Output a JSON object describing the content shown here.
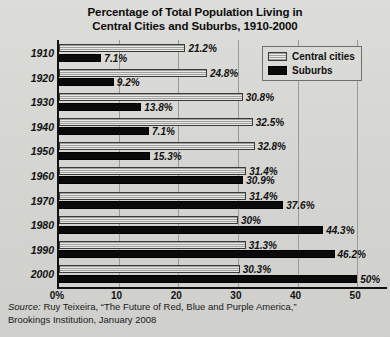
{
  "chart_data": {
    "type": "bar",
    "orientation": "horizontal",
    "title": "Percentage of Total Population Living in Central Cities and Suburbs, 1910-2000",
    "title_lines": [
      "Percentage of Total Population Living in",
      "Central Cities and Suburbs, 1910-2000"
    ],
    "xlabel": "",
    "ylabel": "",
    "xlim": [
      0,
      55
    ],
    "xticks": [
      0,
      10,
      20,
      30,
      40,
      50
    ],
    "xtick_labels": [
      "0%",
      "10",
      "20",
      "30",
      "40",
      "50"
    ],
    "grid": true,
    "legend_position": "top-right",
    "categories": [
      "1910",
      "1920",
      "1930",
      "1940",
      "1950",
      "1960",
      "1970",
      "1980",
      "1990",
      "2000"
    ],
    "series": [
      {
        "name": "Central cities",
        "color": "#9e9e9a",
        "values": [
          21.2,
          24.8,
          30.8,
          32.5,
          32.8,
          31.4,
          31.4,
          30.0,
          31.3,
          30.3
        ],
        "labels": [
          "21.2%",
          "24.8%",
          "30.8%",
          "32.5%",
          "32.8%",
          "31.4%",
          "31.4%",
          "30%",
          "31.3%",
          "30.3%"
        ]
      },
      {
        "name": "Suburbs",
        "color": "#0a0a0a",
        "values": [
          7.1,
          9.2,
          13.8,
          15.1,
          15.3,
          30.9,
          37.6,
          44.3,
          46.2,
          50.0
        ],
        "labels": [
          "7.1%",
          "9.2%",
          "13.8%",
          "7.1%",
          "15.3%",
          "30.9%",
          "37.6%",
          "44.3%",
          "46.2%",
          "50%"
        ]
      }
    ]
  },
  "legend": {
    "items": [
      {
        "label": "Central cities",
        "key": "central"
      },
      {
        "label": "Suburbs",
        "key": "suburbs"
      }
    ]
  },
  "source": {
    "lead": "Source:",
    "line1_rest": " Ruy Teixeira, “The Future of Red, Blue and Purple America,”",
    "line2": "Brookings Institution, January 2008"
  }
}
